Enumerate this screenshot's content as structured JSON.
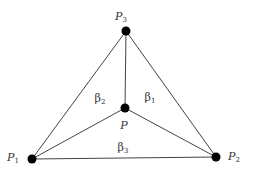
{
  "diagram": {
    "title": "",
    "vertices": [
      {
        "id": "P1",
        "label": "P",
        "sub": "1",
        "x": 32,
        "y": 159
      },
      {
        "id": "P2",
        "label": "P",
        "sub": "2",
        "x": 216,
        "y": 157
      },
      {
        "id": "P3",
        "label": "P",
        "sub": "3",
        "x": 126,
        "y": 31
      },
      {
        "id": "P",
        "label": "P",
        "sub": "",
        "x": 125,
        "y": 108
      }
    ],
    "edges": [
      [
        "P1",
        "P2"
      ],
      [
        "P2",
        "P3"
      ],
      [
        "P3",
        "P1"
      ],
      [
        "P",
        "P1"
      ],
      [
        "P",
        "P2"
      ],
      [
        "P",
        "P3"
      ]
    ],
    "regions": [
      {
        "label": "β",
        "sub": "1"
      },
      {
        "label": "β",
        "sub": "2"
      },
      {
        "label": "β",
        "sub": "3"
      }
    ],
    "colors": {
      "line": "#444444",
      "vertex": "#000000",
      "text": "#333333"
    }
  }
}
